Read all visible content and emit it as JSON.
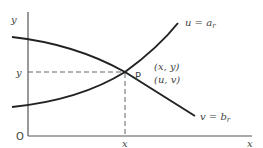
{
  "diagram": {
    "axes": {
      "x_label": "x",
      "y_label": "y",
      "origin_label": "O",
      "x_tick_label": "x",
      "y_tick_label": "y"
    },
    "point": {
      "name": "P",
      "coords_xy": "(x, y)",
      "coords_uv": "(u, v)"
    },
    "curves": [
      {
        "name": "u-curve",
        "label_main": "u = a",
        "label_sub": "r"
      },
      {
        "name": "v-curve",
        "label_main": "v = b",
        "label_sub": "r"
      }
    ],
    "colors": {
      "axis": "#555555",
      "curve": "#222222",
      "dashed": "#666666",
      "text": "#444444"
    }
  }
}
